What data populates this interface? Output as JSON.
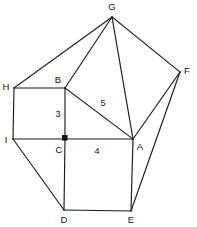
{
  "figure": {
    "background_color": "#ffffff",
    "stroke_color": "#1b1b1b",
    "label_color": "#111111"
  },
  "vertices": [
    {
      "name": "G",
      "label": "G",
      "x": 112,
      "y": 17,
      "label_x": 112,
      "label_y": 7,
      "anchor": "middle"
    },
    {
      "name": "F",
      "label": "F",
      "x": 180,
      "y": 72,
      "label_x": 187,
      "label_y": 71,
      "anchor": "middle"
    },
    {
      "name": "H",
      "label": "H",
      "x": 14,
      "y": 88,
      "label_x": 6,
      "label_y": 87,
      "anchor": "middle"
    },
    {
      "name": "B",
      "label": "B",
      "x": 65,
      "y": 88,
      "label_x": 58,
      "label_y": 80,
      "anchor": "middle"
    },
    {
      "name": "I",
      "label": "I",
      "x": 13,
      "y": 139,
      "label_x": 6,
      "label_y": 140,
      "anchor": "middle"
    },
    {
      "name": "C",
      "label": "C",
      "x": 65,
      "y": 139,
      "label_x": 59,
      "label_y": 150,
      "anchor": "middle"
    },
    {
      "name": "A",
      "label": "A",
      "x": 133,
      "y": 139,
      "label_x": 140,
      "label_y": 147,
      "anchor": "middle"
    },
    {
      "name": "D",
      "label": "D",
      "x": 64,
      "y": 210,
      "label_x": 64,
      "label_y": 220,
      "anchor": "middle"
    },
    {
      "name": "E",
      "label": "E",
      "x": 131,
      "y": 211,
      "label_x": 131,
      "label_y": 220,
      "anchor": "middle"
    }
  ],
  "edges": [
    {
      "name": "edge-H-B",
      "from": "H",
      "to": "B"
    },
    {
      "name": "edge-B-I-side-H-I",
      "from": "H",
      "to": "I"
    },
    {
      "name": "edge-I-C",
      "from": "I",
      "to": "C"
    },
    {
      "name": "edge-B-C",
      "from": "B",
      "to": "C"
    },
    {
      "name": "edge-C-A",
      "from": "C",
      "to": "A"
    },
    {
      "name": "edge-B-A-hypotenuse",
      "from": "B",
      "to": "A"
    },
    {
      "name": "edge-C-D",
      "from": "C",
      "to": "D"
    },
    {
      "name": "edge-D-E",
      "from": "D",
      "to": "E"
    },
    {
      "name": "edge-E-A",
      "from": "E",
      "to": "A"
    },
    {
      "name": "edge-H-G",
      "from": "H",
      "to": "G"
    },
    {
      "name": "edge-B-G",
      "from": "B",
      "to": "G"
    },
    {
      "name": "edge-G-A",
      "from": "G",
      "to": "A"
    },
    {
      "name": "edge-G-F",
      "from": "G",
      "to": "F"
    },
    {
      "name": "edge-A-F",
      "from": "A",
      "to": "F"
    },
    {
      "name": "edge-E-F",
      "from": "E",
      "to": "F"
    },
    {
      "name": "edge-I-D",
      "from": "I",
      "to": "D"
    }
  ],
  "length_labels": [
    {
      "name": "length-label-bc",
      "text": "3",
      "x": 58,
      "y": 115
    },
    {
      "name": "length-label-ab",
      "text": "5",
      "x": 103,
      "y": 104
    },
    {
      "name": "length-label-ca",
      "text": "4",
      "x": 97,
      "y": 152
    }
  ],
  "right_angle_marker": {
    "name": "right-angle-marker-c",
    "x": 62,
    "y": 135,
    "size": 5.5
  }
}
